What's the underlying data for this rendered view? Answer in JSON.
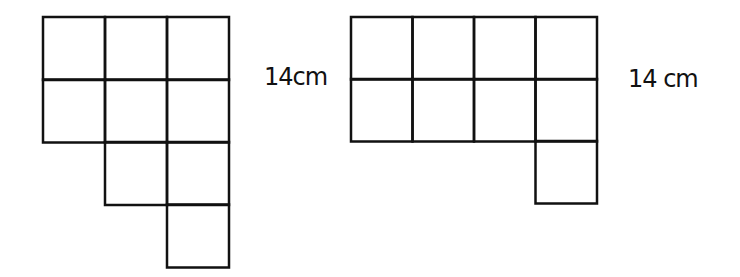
{
  "figures": [
    {
      "name": "left-figure",
      "label": "14cm",
      "cells": [
        [
          0,
          0
        ],
        [
          1,
          0
        ],
        [
          2,
          0
        ],
        [
          0,
          1
        ],
        [
          1,
          1
        ],
        [
          2,
          1
        ],
        [
          1,
          2
        ],
        [
          2,
          2
        ],
        [
          2,
          3
        ]
      ],
      "origin": [
        43,
        17
      ],
      "cell_size": 62
    },
    {
      "name": "right-figure",
      "label": "14 cm",
      "cells": [
        [
          0,
          0
        ],
        [
          1,
          0
        ],
        [
          2,
          0
        ],
        [
          3,
          0
        ],
        [
          0,
          1
        ],
        [
          1,
          1
        ],
        [
          2,
          1
        ],
        [
          3,
          1
        ],
        [
          3,
          2
        ]
      ],
      "origin": [
        351,
        17
      ],
      "cell_size": 61.5
    }
  ],
  "labels": {
    "left": "14cm",
    "right": "14 cm"
  },
  "colors": {
    "stroke": "#111111",
    "background": "#ffffff"
  }
}
